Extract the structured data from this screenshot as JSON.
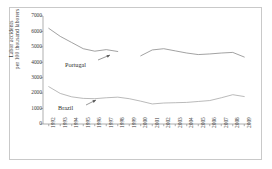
{
  "chart_data": {
    "type": "line",
    "title": "",
    "xlabel": "",
    "ylabel_line1": "Labor accidents",
    "ylabel_line2": "per 100 thousand laborers",
    "ylim": [
      0,
      7000
    ],
    "yticks": [
      0,
      1000,
      2000,
      3000,
      4000,
      5000,
      6000,
      7000
    ],
    "grid": false,
    "legend_position": "inline-annotations",
    "x": [
      1992,
      1993,
      1994,
      1995,
      1996,
      1997,
      1998,
      1999,
      2000,
      2001,
      2002,
      2003,
      2004,
      2005,
      2006,
      2007,
      2008,
      2009
    ],
    "categories": [
      "1992",
      "1993",
      "1994",
      "1995",
      "1996",
      "1997",
      "1998",
      "1999",
      "2000",
      "2001",
      "2002",
      "2003",
      "2004",
      "2005",
      "2006",
      "2007",
      "2008",
      "2009"
    ],
    "series": [
      {
        "name": "Portugal",
        "color": "#8a8a8a",
        "values": [
          6200,
          5680,
          5280,
          4880,
          4720,
          4820,
          4700,
          null,
          4420,
          4800,
          4880,
          4740,
          4600,
          4500,
          4540,
          4600,
          4640,
          4340
        ]
      },
      {
        "name": "Brazil",
        "color": "#a8a8a8",
        "values": [
          2420,
          1980,
          1760,
          1660,
          1640,
          1700,
          1740,
          1640,
          1480,
          1300,
          1360,
          1380,
          1400,
          1460,
          1520,
          1700,
          1900,
          1780
        ]
      }
    ],
    "annotations": [
      {
        "text": "Portugal",
        "series": "Portugal"
      },
      {
        "text": "Brazil",
        "series": "Brazil"
      }
    ]
  },
  "axis": {
    "y_tick_labels": [
      "7000",
      "6000",
      "5000",
      "4000",
      "3000",
      "2000",
      "1000",
      "0"
    ],
    "x_tick_labels": [
      "1992",
      "1993",
      "1994",
      "1995",
      "1996",
      "1997",
      "1998",
      "1999",
      "2000",
      "2001",
      "2002",
      "2003",
      "2004",
      "2005",
      "2006",
      "2007",
      "2008",
      "2009"
    ]
  },
  "colors": {
    "frame": "#c9c9c9",
    "axis": "#8e8e8e",
    "text": "#3a3a3a",
    "portugal": "#8a8a8a",
    "brazil": "#a8a8a8",
    "background": "#ffffff"
  }
}
